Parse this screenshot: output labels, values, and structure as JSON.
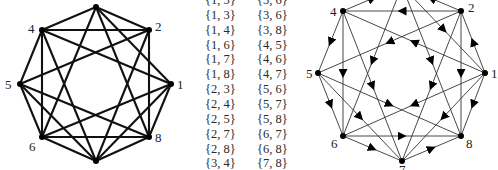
{
  "undirected_graph": {
    "nodes": [
      {
        "id": "1",
        "x": 171,
        "y": 84,
        "label": "1",
        "lx": 177,
        "ly": 89,
        "show_label": true
      },
      {
        "id": "2",
        "x": 149,
        "y": 30,
        "label": "2",
        "lx": 155,
        "ly": 31,
        "show_label": true
      },
      {
        "id": "3",
        "x": 96,
        "y": 7,
        "label": "3",
        "lx": 0,
        "ly": 0,
        "show_label": false
      },
      {
        "id": "4",
        "x": 42,
        "y": 30,
        "label": "4",
        "lx": 28,
        "ly": 33,
        "show_label": true
      },
      {
        "id": "5",
        "x": 20,
        "y": 84,
        "label": "5",
        "lx": 5,
        "ly": 89,
        "show_label": true
      },
      {
        "id": "6",
        "x": 42,
        "y": 137,
        "label": "6",
        "lx": 29,
        "ly": 151,
        "show_label": true
      },
      {
        "id": "7",
        "x": 96,
        "y": 161,
        "label": "7",
        "lx": 0,
        "ly": 0,
        "show_label": false
      },
      {
        "id": "8",
        "x": 149,
        "y": 137,
        "label": "8",
        "lx": 155,
        "ly": 142,
        "show_label": true
      }
    ]
  },
  "edge_table": {
    "column_1": [
      "{1, 3}",
      "{1, 3}",
      "{1, 4}",
      "{1, 6}",
      "{1, 7}",
      "{1, 8}",
      "{2, 3}",
      "{2, 4}",
      "{2, 5}",
      "{2, 7}",
      "{2, 8}",
      "{3, 4}"
    ],
    "column_2": [
      "{3, 6}",
      "{3, 6}",
      "{3, 8}",
      "{4, 5}",
      "{4, 6}",
      "{4, 7}",
      "{5, 6}",
      "{5, 7}",
      "{5, 8}",
      "{6, 7}",
      "{6, 8}",
      "{7, 8}"
    ],
    "edges": [
      [
        1,
        3
      ],
      [
        1,
        4
      ],
      [
        1,
        6
      ],
      [
        1,
        7
      ],
      [
        1,
        8
      ],
      [
        2,
        3
      ],
      [
        2,
        4
      ],
      [
        2,
        5
      ],
      [
        2,
        7
      ],
      [
        2,
        8
      ],
      [
        3,
        4
      ],
      [
        3,
        6
      ],
      [
        3,
        8
      ],
      [
        4,
        5
      ],
      [
        4,
        6
      ],
      [
        4,
        7
      ],
      [
        5,
        6
      ],
      [
        5,
        7
      ],
      [
        5,
        8
      ],
      [
        6,
        7
      ],
      [
        6,
        8
      ],
      [
        7,
        8
      ]
    ]
  },
  "directed_graph": {
    "nodes": [
      {
        "id": "1",
        "x": 485,
        "y": 73,
        "label": "1",
        "lx": 491,
        "ly": 78,
        "show_label": true
      },
      {
        "id": "2",
        "x": 461,
        "y": 11,
        "label": "2",
        "lx": 468,
        "ly": 12,
        "show_label": true
      },
      {
        "id": "3",
        "x": 402,
        "y": -14,
        "label": "3",
        "lx": 0,
        "ly": 0,
        "show_label": false
      },
      {
        "id": "4",
        "x": 343,
        "y": 11,
        "label": "4",
        "lx": 330,
        "ly": 16,
        "show_label": true
      },
      {
        "id": "5",
        "x": 318,
        "y": 73,
        "label": "5",
        "lx": 306,
        "ly": 78,
        "show_label": true
      },
      {
        "id": "6",
        "x": 343,
        "y": 136,
        "label": "6",
        "lx": 331,
        "ly": 148,
        "show_label": true
      },
      {
        "id": "7",
        "x": 402,
        "y": 161,
        "label": "7",
        "lx": 399,
        "ly": 174,
        "show_label": true
      },
      {
        "id": "8",
        "x": 461,
        "y": 136,
        "label": "8",
        "lx": 466,
        "ly": 148,
        "show_label": true
      }
    ],
    "arcs": [
      [
        1,
        2
      ],
      [
        2,
        3
      ],
      [
        4,
        3
      ],
      [
        2,
        4
      ],
      [
        4,
        5
      ],
      [
        5,
        6
      ],
      [
        6,
        7
      ],
      [
        7,
        8
      ],
      [
        1,
        8
      ],
      [
        2,
        8
      ],
      [
        4,
        6
      ],
      [
        6,
        8
      ],
      [
        3,
        1
      ],
      [
        3,
        6
      ],
      [
        3,
        8
      ],
      [
        1,
        4
      ],
      [
        2,
        5
      ],
      [
        2,
        7
      ],
      [
        1,
        6
      ],
      [
        1,
        7
      ],
      [
        4,
        7
      ],
      [
        5,
        7
      ],
      [
        5,
        8
      ]
    ]
  },
  "colors": {
    "edge": "#111111",
    "node": "#000000",
    "text": "#222222",
    "background": "#ffffff"
  }
}
